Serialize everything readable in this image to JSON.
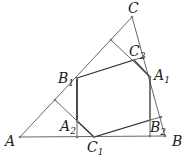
{
  "diagram": {
    "type": "geometry",
    "labels": {
      "A": "A",
      "B": "B",
      "C": "C",
      "A1": "A",
      "A1_sub": "1",
      "B1": "B",
      "B1_sub": "1",
      "C1": "C",
      "C1_sub": "1",
      "A2": "A",
      "A2_sub": "2",
      "B2": "B",
      "B2_sub": "2",
      "C2": "C",
      "C2_sub": "2"
    },
    "points": {
      "A": [
        20,
        137
      ],
      "B": [
        165,
        136
      ],
      "C": [
        132,
        17
      ],
      "A1": [
        150,
        77
      ],
      "B1": [
        77,
        78
      ],
      "C1": [
        94,
        137
      ],
      "A2": [
        77,
        121
      ],
      "B2": [
        150,
        120
      ],
      "C2": [
        134,
        60
      ]
    },
    "colors": {
      "lines": "#555555",
      "hexagon": "#333333",
      "text": "#222222"
    }
  }
}
